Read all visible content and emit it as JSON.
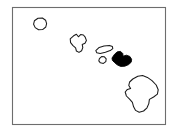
{
  "figure": {
    "width": 178,
    "height": 133,
    "background_color": "#ffffff"
  },
  "frame": {
    "name": "map-border",
    "x": 12,
    "y": 7,
    "width": 153,
    "height": 117,
    "stroke_color": "#6d6d6d",
    "fill_color": "#ffffff"
  },
  "map": {
    "type": "choropleth-outline",
    "region": "Hawaii",
    "outline_color": "#1a1a1a",
    "highlight_color": "#000000",
    "unhighlighted_fill": "#ffffff",
    "highlighted_count": 1,
    "island_count": 6
  },
  "islands": [
    {
      "name": "kauai",
      "label": "Kauai",
      "highlighted": false,
      "position": "upper-left",
      "bbox": [
        33,
        18,
        14,
        13
      ],
      "path": "M38.0,18.3 L42.4,18.0 L45.6,20.2 L46.6,23.6 L45.8,27.0 L42.6,29.6 L38.6,29.8 L35.2,27.6 L33.6,24.2 L34.4,20.8 Z"
    },
    {
      "name": "niihau",
      "label": "Niihau",
      "highlighted": false,
      "position": "far-left",
      "bbox": [
        0,
        0,
        0,
        0
      ],
      "path": ""
    },
    {
      "name": "oahu",
      "label": "Oahu",
      "highlighted": false,
      "position": "center-left",
      "bbox": [
        70,
        34,
        19,
        19
      ],
      "path": "M73.6,35.8 L76.4,34.2 L78.4,36.8 L80.6,34.6 L83.4,35.0 L85.2,37.2 L86.4,40.4 L85.0,43.2 L82.2,44.4 L82.8,47.6 L81.6,50.8 L79.0,52.4 L76.4,51.0 L75.6,47.8 L73.0,45.6 L70.6,42.6 L70.2,38.8 Z"
    },
    {
      "name": "molokai",
      "label": "Molokai",
      "highlighted": false,
      "position": "center",
      "bbox": [
        95,
        45,
        18,
        9
      ],
      "path": "M95.8,50.6 L99.2,47.4 L104.0,46.0 L109.4,45.4 L112.4,46.6 L112.8,48.6 L110.2,50.6 L105.4,52.2 L100.2,53.4 L96.8,52.8 Z"
    },
    {
      "name": "lanai",
      "label": "Lanai",
      "highlighted": false,
      "position": "center-lower",
      "bbox": [
        98,
        56,
        9,
        8
      ],
      "path": "M99.4,58.6 L101.6,56.6 L104.4,56.8 L106.2,58.8 L105.8,61.6 L103.4,63.4 L100.4,62.8 L98.8,60.8 Z"
    },
    {
      "name": "maui",
      "label": "Maui",
      "highlighted": true,
      "position": "center-right",
      "bbox": [
        111,
        51,
        21,
        16
      ],
      "path": "M112.0,58.0 L114.6,54.2 L117.4,51.8 L120.6,51.4 L122.8,53.6 L123.0,56.2 L126.4,55.2 L129.8,56.4 L131.6,59.2 L131.2,62.2 L128.6,64.6 L124.8,66.2 L120.6,66.4 L117.2,64.8 L114.4,62.4 L112.4,60.4 Z"
    },
    {
      "name": "hawaii-big-island",
      "label": "Hawaii",
      "highlighted": false,
      "position": "lower-right",
      "bbox": [
        125,
        75,
        34,
        38
      ],
      "path": "M137.8,76.2 L142.6,75.6 L147.4,77.4 L152.0,80.6 L156.2,85.0 L158.2,89.8 L157.4,94.2 L153.6,97.0 L149.4,99.4 L148.8,103.6 L147.0,107.8 L143.6,111.0 L139.2,112.2 L135.6,110.4 L133.6,106.8 L132.4,102.4 L129.6,99.2 L126.4,96.0 L125.2,92.0 L127.4,89.4 L130.6,88.6 L128.8,85.4 L129.6,82.0 L132.8,79.0 Z"
    }
  ]
}
